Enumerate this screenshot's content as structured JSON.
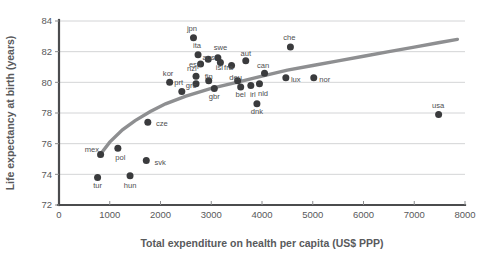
{
  "chart_data": {
    "type": "scatter",
    "title": "",
    "xlabel": "Total expenditure on health per capita (US$ PPP)",
    "ylabel": "Life expectancy at birth (years)",
    "xlim": [
      0,
      8000
    ],
    "ylim": [
      72,
      84
    ],
    "xticks": [
      0,
      1000,
      2000,
      3000,
      4000,
      5000,
      6000,
      7000,
      8000
    ],
    "xtick_labels": [
      "0",
      "1000",
      "2000",
      "3000",
      "4000",
      "5000",
      "6000",
      "7000",
      "8000"
    ],
    "yticks": [
      72,
      74,
      76,
      78,
      80,
      82,
      84
    ],
    "ytick_labels": [
      "72",
      "74",
      "76",
      "78",
      "80",
      "82",
      "84"
    ],
    "grid": "horizontal",
    "legend": "none",
    "point_color": "#3a3b3d",
    "trend_color": "#8e8f91",
    "grid_color": "#c8c9cb",
    "axis_color": "#4b4c4e",
    "points": [
      {
        "label": "tur",
        "x": 760,
        "y": 73.8,
        "lx": 760,
        "ly": 73.3,
        "anchor": "middle"
      },
      {
        "label": "mex",
        "x": 820,
        "y": 75.3,
        "lx": 650,
        "ly": 75.6,
        "anchor": "middle"
      },
      {
        "label": "pol",
        "x": 1160,
        "y": 75.7,
        "lx": 1210,
        "ly": 75.1,
        "anchor": "middle"
      },
      {
        "label": "hun",
        "x": 1400,
        "y": 73.9,
        "lx": 1400,
        "ly": 73.3,
        "anchor": "middle"
      },
      {
        "label": "svk",
        "x": 1720,
        "y": 74.9,
        "lx": 1880,
        "ly": 74.8,
        "anchor": "start"
      },
      {
        "label": "cze",
        "x": 1750,
        "y": 77.4,
        "lx": 1910,
        "ly": 77.3,
        "anchor": "start"
      },
      {
        "label": "kor",
        "x": 2180,
        "y": 80.0,
        "lx": 2150,
        "ly": 80.6,
        "anchor": "middle"
      },
      {
        "label": "prt",
        "x": 2420,
        "y": 79.4,
        "lx": 2360,
        "ly": 80.0,
        "anchor": "middle"
      },
      {
        "label": "nzl",
        "x": 2700,
        "y": 80.4,
        "lx": 2620,
        "ly": 80.9,
        "anchor": "middle"
      },
      {
        "label": "grc",
        "x": 2700,
        "y": 79.9,
        "lx": 2600,
        "ly": 79.8,
        "anchor": "middle"
      },
      {
        "label": "jpn",
        "x": 2650,
        "y": 82.9,
        "lx": 2620,
        "ly": 83.5,
        "anchor": "middle"
      },
      {
        "label": "ita",
        "x": 2740,
        "y": 81.8,
        "lx": 2720,
        "ly": 82.4,
        "anchor": "middle"
      },
      {
        "label": "esp",
        "x": 2790,
        "y": 81.2,
        "lx": 2680,
        "ly": 81.2,
        "anchor": "middle"
      },
      {
        "label": "aus",
        "x": 2940,
        "y": 81.5,
        "lx": 2950,
        "ly": 81.6,
        "anchor": "middle"
      },
      {
        "label": "fin",
        "x": 2950,
        "y": 80.1,
        "lx": 2950,
        "ly": 80.4,
        "anchor": "middle"
      },
      {
        "label": "swe",
        "x": 3130,
        "y": 81.6,
        "lx": 3180,
        "ly": 82.3,
        "anchor": "middle"
      },
      {
        "label": "isl",
        "x": 3180,
        "y": 81.3,
        "lx": 3160,
        "ly": 81.0,
        "anchor": "middle"
      },
      {
        "label": "gbr",
        "x": 3060,
        "y": 79.6,
        "lx": 3060,
        "ly": 79.1,
        "anchor": "middle"
      },
      {
        "label": "fra",
        "x": 3400,
        "y": 81.1,
        "lx": 3340,
        "ly": 81.0,
        "anchor": "middle"
      },
      {
        "label": "deu",
        "x": 3520,
        "y": 80.1,
        "lx": 3480,
        "ly": 80.3,
        "anchor": "middle"
      },
      {
        "label": "aut",
        "x": 3680,
        "y": 81.4,
        "lx": 3680,
        "ly": 81.9,
        "anchor": "middle"
      },
      {
        "label": "bel",
        "x": 3580,
        "y": 79.7,
        "lx": 3580,
        "ly": 79.2,
        "anchor": "middle"
      },
      {
        "label": "irl",
        "x": 3780,
        "y": 79.8,
        "lx": 3820,
        "ly": 79.2,
        "anchor": "middle"
      },
      {
        "label": "nld",
        "x": 3950,
        "y": 79.9,
        "lx": 4020,
        "ly": 79.3,
        "anchor": "middle"
      },
      {
        "label": "dnk",
        "x": 3900,
        "y": 78.6,
        "lx": 3900,
        "ly": 78.1,
        "anchor": "middle"
      },
      {
        "label": "can",
        "x": 4050,
        "y": 80.6,
        "lx": 4020,
        "ly": 81.1,
        "anchor": "middle"
      },
      {
        "label": "lux",
        "x": 4470,
        "y": 80.3,
        "lx": 4570,
        "ly": 80.2,
        "anchor": "start"
      },
      {
        "label": "che",
        "x": 4560,
        "y": 82.3,
        "lx": 4540,
        "ly": 82.9,
        "anchor": "middle"
      },
      {
        "label": "nor",
        "x": 5020,
        "y": 80.3,
        "lx": 5130,
        "ly": 80.2,
        "anchor": "start"
      },
      {
        "label": "usa",
        "x": 7480,
        "y": 77.9,
        "lx": 7470,
        "ly": 78.5,
        "anchor": "middle"
      }
    ],
    "trend_curve": [
      {
        "x": 790,
        "y": 75.2
      },
      {
        "x": 1000,
        "y": 76.1
      },
      {
        "x": 1250,
        "y": 76.9
      },
      {
        "x": 1500,
        "y": 77.5
      },
      {
        "x": 1800,
        "y": 78.1
      },
      {
        "x": 2100,
        "y": 78.6
      },
      {
        "x": 2500,
        "y": 79.1
      },
      {
        "x": 3000,
        "y": 79.6
      },
      {
        "x": 3500,
        "y": 80.0
      },
      {
        "x": 4000,
        "y": 80.4
      },
      {
        "x": 4500,
        "y": 80.8
      },
      {
        "x": 5000,
        "y": 81.1
      },
      {
        "x": 5500,
        "y": 81.4
      },
      {
        "x": 6000,
        "y": 81.7
      },
      {
        "x": 6500,
        "y": 82.0
      },
      {
        "x": 7000,
        "y": 82.3
      },
      {
        "x": 7500,
        "y": 82.6
      },
      {
        "x": 7850,
        "y": 82.8
      }
    ]
  }
}
